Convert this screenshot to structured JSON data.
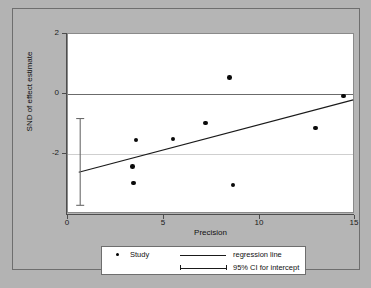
{
  "chart_data": {
    "type": "scatter",
    "title": "",
    "xlabel": "Precision",
    "ylabel": "SND of effect estimate",
    "xlim": [
      -0.6,
      15.4
    ],
    "ylim": [
      -3.25,
      2.35
    ],
    "xticks": [
      0,
      5,
      10,
      15
    ],
    "xticklabels": [
      "0",
      "5",
      "10",
      "15"
    ],
    "yticks": [
      2,
      0,
      -2
    ],
    "yticklabels": [
      "2",
      "0",
      "-2"
    ],
    "grid": "reference lines at y=0 and y=-2",
    "legend_position": "below-axes",
    "series": [
      {
        "name": "Study",
        "type": "scatter",
        "marker": "filled-circle",
        "color": "#0a0a0a",
        "points": [
          {
            "x": 3.0,
            "y": -1.78
          },
          {
            "x": 3.05,
            "y": -2.28
          },
          {
            "x": 3.2,
            "y": -0.95
          },
          {
            "x": 5.25,
            "y": -0.92
          },
          {
            "x": 7.05,
            "y": -0.42
          },
          {
            "x": 8.4,
            "y": 1.0
          },
          {
            "x": 8.6,
            "y": -2.35
          },
          {
            "x": 13.2,
            "y": -0.58
          },
          {
            "x": 14.75,
            "y": 0.42
          }
        ]
      },
      {
        "name": "regression line",
        "type": "line",
        "color": "#1a1a1a",
        "x": [
          0,
          15.3
        ],
        "y": [
          -1.95,
          0.3
        ]
      },
      {
        "name": "95% CI for intercept",
        "type": "errorbar",
        "color": "#6a6a6a",
        "x": 0.08,
        "center": -1.95,
        "low": -2.98,
        "high": -0.28
      }
    ],
    "legend": [
      {
        "key": "study",
        "marker": "filled-circle",
        "label": "Study"
      },
      {
        "key": "regression",
        "marker": "solid-line",
        "label": "regression line"
      },
      {
        "key": "ci",
        "marker": "error-bar",
        "label": "95% CI for intercept"
      }
    ]
  }
}
